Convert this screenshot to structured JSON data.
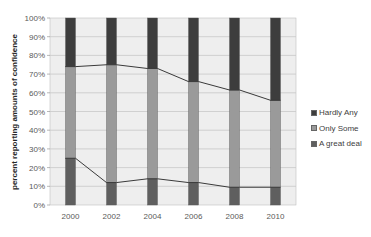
{
  "chart_data": {
    "type": "bar",
    "stacked": true,
    "title": "",
    "xlabel": "",
    "ylabel": "percent reporting amounts of confidence",
    "categories": [
      "2000",
      "2002",
      "2004",
      "2006",
      "2008",
      "2010"
    ],
    "series": [
      {
        "name": "A great deal",
        "values": [
          25,
          12,
          14,
          12,
          9.5,
          9.5
        ],
        "color": "#5f5f5f"
      },
      {
        "name": "Only Some",
        "values": [
          49,
          63,
          59,
          54,
          52,
          46.5
        ],
        "color": "#9a9a9a"
      },
      {
        "name": "Hardly Any",
        "values": [
          26,
          25,
          27,
          34,
          38.5,
          44
        ],
        "color": "#3d3d3d"
      }
    ],
    "series_lines": "Connector lines join the tops of each stacked segment across years",
    "yticks": [
      "0%",
      "10%",
      "20%",
      "30%",
      "40%",
      "50%",
      "60%",
      "70%",
      "80%",
      "90%",
      "100%"
    ],
    "ylim": [
      0,
      100
    ],
    "grid": true,
    "legend_position": "right",
    "legend": [
      "Hardly Any",
      "Only Some",
      "A great deal"
    ]
  },
  "legend": {
    "items": [
      {
        "label": "Hardly Any",
        "color": "#3d3d3d"
      },
      {
        "label": "Only Some",
        "color": "#9a9a9a"
      },
      {
        "label": "A great deal",
        "color": "#5f5f5f"
      }
    ]
  }
}
